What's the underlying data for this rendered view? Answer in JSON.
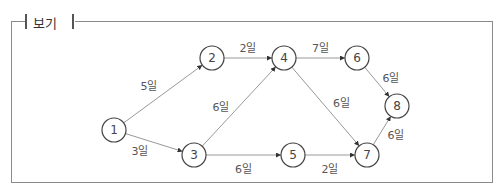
{
  "box": {
    "title": "보기"
  },
  "nodes": [
    {
      "id": "1",
      "x": 114,
      "y": 130
    },
    {
      "id": "2",
      "x": 212,
      "y": 58
    },
    {
      "id": "3",
      "x": 194,
      "y": 155
    },
    {
      "id": "4",
      "x": 284,
      "y": 58
    },
    {
      "id": "5",
      "x": 293,
      "y": 155
    },
    {
      "id": "6",
      "x": 357,
      "y": 58
    },
    {
      "id": "7",
      "x": 367,
      "y": 155
    },
    {
      "id": "8",
      "x": 397,
      "y": 106
    }
  ],
  "edges": [
    {
      "from": "1",
      "to": "2",
      "label": "5일"
    },
    {
      "from": "1",
      "to": "3",
      "label": "3일"
    },
    {
      "from": "2",
      "to": "4",
      "label": "2일"
    },
    {
      "from": "3",
      "to": "4",
      "label": "6일"
    },
    {
      "from": "3",
      "to": "5",
      "label": "6일"
    },
    {
      "from": "4",
      "to": "6",
      "label": "7일"
    },
    {
      "from": "4",
      "to": "7",
      "label": "6일"
    },
    {
      "from": "5",
      "to": "7",
      "label": "2일"
    },
    {
      "from": "6",
      "to": "8",
      "label": "6일"
    },
    {
      "from": "7",
      "to": "8",
      "label": "6일"
    }
  ]
}
